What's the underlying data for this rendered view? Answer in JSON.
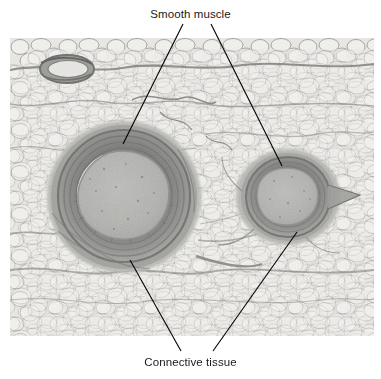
{
  "figure": {
    "type": "histology-micrograph",
    "caption_labels": {
      "top": "Smooth muscle",
      "bottom": "Connective tissue"
    },
    "colors": {
      "background": "#ffffff",
      "text": "#1a1a1a",
      "leader_line": "#000000",
      "adipose_cell_fill": "#ededeb",
      "adipose_septa": "#8d8d8a",
      "tunica_media": "#8b8b8a",
      "tunica_media_dark": "#6e6e6d",
      "lumen_fill": "#b4b4b2",
      "lumen_edge": "#f2f2f0",
      "adventitia": "#a9a9a6"
    },
    "annotations": [
      {
        "name": "smooth-muscle-left",
        "label": "Smooth muscle",
        "line": {
          "x1": 183,
          "y1": 24,
          "x2": 123,
          "y2": 144
        },
        "points_to": "large-vessel-tunica-media"
      },
      {
        "name": "smooth-muscle-right",
        "label": "Smooth muscle",
        "line": {
          "x1": 211,
          "y1": 24,
          "x2": 282,
          "y2": 166
        },
        "points_to": "small-vessel-tunica-media"
      },
      {
        "name": "connective-tissue-left",
        "label": "Connective tissue",
        "line": {
          "x1": 130,
          "y1": 260,
          "x2": 181,
          "y2": 351
        },
        "points_to": "large-vessel-adventitia"
      },
      {
        "name": "connective-tissue-right",
        "label": "Connective tissue",
        "line": {
          "x1": 297,
          "y1": 232,
          "x2": 213,
          "y2": 351
        },
        "points_to": "small-vessel-adventitia"
      }
    ],
    "specimen": {
      "tissue": "adipose tissue with neurovascular bundle",
      "structures": [
        {
          "name": "artery",
          "role": "large-vessel",
          "cx": 124,
          "cy": 197,
          "rx": 66,
          "ry": 67
        },
        {
          "name": "vein",
          "role": "small-vessel",
          "cx": 288,
          "cy": 197,
          "rx": 43,
          "ry": 42
        },
        {
          "name": "small-vessel-upper-left",
          "role": "accessory-vessel",
          "cx": 67,
          "cy": 69,
          "rx": 23,
          "ry": 11
        }
      ]
    },
    "micrograph_frame": {
      "x": 10,
      "y": 38,
      "width": 364,
      "height": 298
    }
  }
}
